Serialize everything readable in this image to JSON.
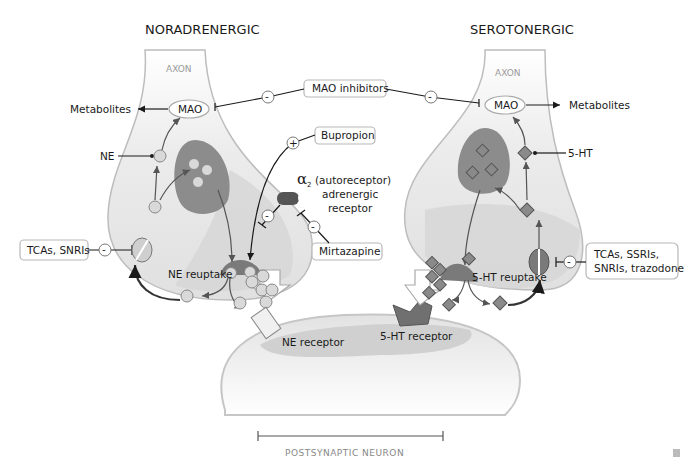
{
  "titles": {
    "left": "NORADRENERGIC",
    "right": "SEROTONERGIC"
  },
  "axon_labels": {
    "left": "AXON",
    "right": "AXON"
  },
  "enzymes": {
    "left_mao": "MAO",
    "right_mao": "MAO"
  },
  "products": {
    "left_metabolites": "Metabolites",
    "right_metabolites": "Metabolites"
  },
  "neurotransmitters": {
    "ne": "NE",
    "five_ht": "5-HT"
  },
  "drugs": {
    "mao_inhibitors": "MAO inhibitors",
    "bupropion": "Bupropion",
    "mirtazapine": "Mirtazapine",
    "tcas_snris": "TCAs, SNRIs",
    "tcas_ssris_line1": "TCAs, SSRIs,",
    "tcas_ssris_line2": "SNRIs, trazodone"
  },
  "receptors": {
    "alpha2_symbol": "α",
    "alpha2_sub": "2",
    "alpha2_line1": "(autoreceptor)",
    "alpha2_line2": "adrenergic",
    "alpha2_line3": "receptor",
    "ne_receptor": "NE receptor",
    "five_ht_receptor": "5-HT receptor"
  },
  "processes": {
    "ne_reuptake": "NE reuptake",
    "five_ht_reuptake": "5-HT reuptake"
  },
  "signs": {
    "minus": "-",
    "plus": "+"
  },
  "footer": {
    "postsynaptic_label": "POSTSYNAPTIC NEURON"
  },
  "colors": {
    "neuron_fill": "#e6e6e6",
    "neuron_inner": "#d0d0d0",
    "vesicle": "#8c8c8c",
    "text": "#1a1a1a"
  }
}
